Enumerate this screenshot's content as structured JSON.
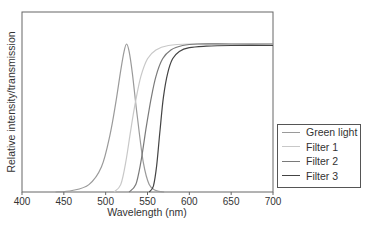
{
  "chart_data": {
    "type": "line",
    "title": "",
    "xlabel": "Wavelength (nm)",
    "ylabel": "Relative intensity/transmission",
    "xlim": [
      400,
      700
    ],
    "ylim": [
      0,
      1
    ],
    "x_ticks": [
      "400",
      "450",
      "500",
      "550",
      "600",
      "650",
      "700"
    ],
    "y_ticks": [],
    "grid": false,
    "legend_position": "right-middle",
    "series": [
      {
        "name": "Green light",
        "color": "#9a9a9a",
        "x": [
          440,
          460,
          480,
          495,
          505,
          512,
          518,
          522,
          525,
          528,
          532,
          538,
          545,
          552,
          560,
          570
        ],
        "y": [
          0.0,
          0.01,
          0.05,
          0.17,
          0.38,
          0.6,
          0.82,
          0.95,
          1.0,
          0.95,
          0.8,
          0.5,
          0.2,
          0.05,
          0.01,
          0.0
        ]
      },
      {
        "name": "Filter 1",
        "color": "#c8c8c8",
        "x": [
          510,
          518,
          524,
          530,
          536,
          542,
          550,
          560,
          575,
          600,
          650,
          700
        ],
        "y": [
          0.0,
          0.05,
          0.2,
          0.42,
          0.62,
          0.78,
          0.9,
          0.96,
          0.99,
          1.0,
          1.0,
          1.0
        ]
      },
      {
        "name": "Filter 2",
        "color": "#7a7a7a",
        "x": [
          528,
          536,
          542,
          548,
          554,
          560,
          568,
          578,
          592,
          610,
          650,
          700
        ],
        "y": [
          0.0,
          0.05,
          0.2,
          0.42,
          0.62,
          0.78,
          0.9,
          0.96,
          0.99,
          1.0,
          1.0,
          1.0
        ]
      },
      {
        "name": "Filter 3",
        "color": "#444444",
        "x": [
          552,
          557,
          561,
          565,
          569,
          574,
          580,
          588,
          600,
          620,
          650,
          700
        ],
        "y": [
          0.0,
          0.04,
          0.18,
          0.42,
          0.64,
          0.8,
          0.9,
          0.95,
          0.975,
          0.985,
          0.99,
          0.99
        ]
      }
    ]
  },
  "legend": {
    "items": [
      {
        "label": "Green light",
        "color": "#9a9a9a"
      },
      {
        "label": "Filter 1",
        "color": "#c8c8c8"
      },
      {
        "label": "Filter 2",
        "color": "#7a7a7a"
      },
      {
        "label": "Filter 3",
        "color": "#444444"
      }
    ]
  }
}
